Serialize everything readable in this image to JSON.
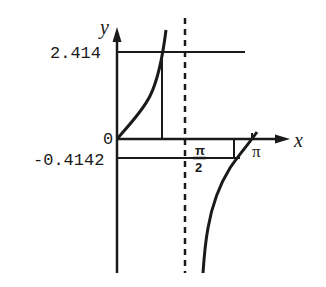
{
  "diagram": {
    "type": "function-graph",
    "function": "tan(x/2 + pi/8) style curve with vertical asymptote",
    "axes": {
      "x_label": "x",
      "y_label": "y",
      "origin_label": "0"
    },
    "y_ticks": [
      {
        "label": "2.414"
      },
      {
        "label": "-0.4142"
      }
    ],
    "x_ticks": [
      {
        "label_num": "π",
        "label_den": "2"
      },
      {
        "label": "π"
      }
    ],
    "asymptote": {
      "style": "dashed",
      "at": "π/2"
    },
    "colors": {
      "ink": "#1a1a1a",
      "background": "#ffffff"
    }
  }
}
